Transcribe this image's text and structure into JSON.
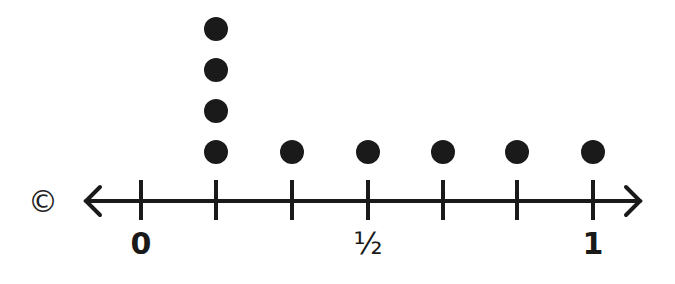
{
  "chart_data": {
    "type": "dot_plot",
    "title": "",
    "xlabel": "",
    "ylabel": "",
    "xlim": [
      0,
      1
    ],
    "ticks": [
      "0",
      "1/6",
      "2/6",
      "1/2",
      "4/6",
      "5/6",
      "1"
    ],
    "tick_labels_shown": [
      {
        "value": 0,
        "label": "0"
      },
      {
        "value": 0.5,
        "label": "½"
      },
      {
        "value": 1,
        "label": "1"
      }
    ],
    "categories": [
      "0",
      "1/6",
      "1/3",
      "1/2",
      "2/3",
      "5/6",
      "1"
    ],
    "values": [
      0,
      4,
      1,
      1,
      1,
      1,
      1
    ],
    "grid": false,
    "legend": null
  },
  "labels": {
    "zero": "0",
    "half": "½",
    "one": "1"
  },
  "copyright_symbol": "©",
  "colors": {
    "ink": "#1a1a1a",
    "background": "#ffffff"
  }
}
